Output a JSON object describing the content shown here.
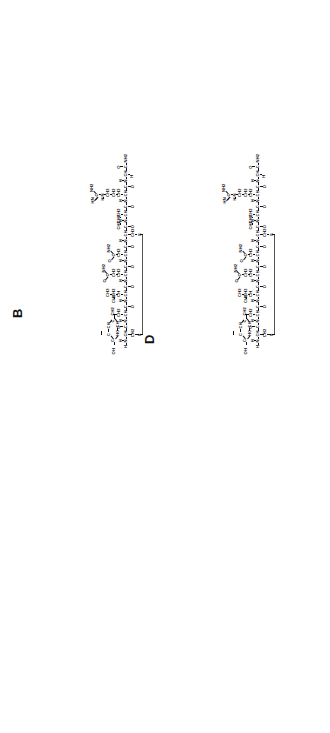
{
  "figure": {
    "orientation": "rotated-90-ccw",
    "background_color": "#ffffff",
    "ink_color": "#111111",
    "bridge_color": "#555555",
    "panel_count": 4
  },
  "panels": [
    {
      "id": "A",
      "label": "A",
      "position": "bottom-left",
      "sequence_label": "peptide-analog-A",
      "has_disulfide_bridge": true,
      "bridge_label": "S-S",
      "highlighted_residue": "C",
      "residues": [
        {
          "name": "Cys1",
          "backbone": "H-N-CH-C=O",
          "side_chain": "CH2-S"
        },
        {
          "name": "Tyr2",
          "backbone": "N-CH-C=O",
          "side_chain": "CH2-phenol-OH"
        },
        {
          "name": "Ile3",
          "backbone": "N-CH-C=O",
          "side_chain": "CH2-CH3"
        },
        {
          "name": "Gln4",
          "backbone": "N-CH-C=O",
          "side_chain": "CH2-CH2-C(=O)-NH2"
        },
        {
          "name": "Asn5",
          "backbone": "N-CH-C=O",
          "side_chain": "CH2-C(=O)-NH2"
        },
        {
          "name": "Cys6",
          "backbone": "N-CH-C=O",
          "side_chain": "CH2-S"
        },
        {
          "name": "Pro7",
          "backbone": "N-CH-C=O",
          "side_chain": "CH2-CH2-CH2"
        },
        {
          "name": "Arg8",
          "backbone": "N-CH-C=O",
          "side_chain": "CH2-CH2-CH2-N-H-C(=NH)-NH2"
        },
        {
          "name": "Gly9",
          "backbone": "N-CH2-C=O",
          "side_chain": "NH2"
        }
      ],
      "atom_labels": [
        "H",
        "N",
        "C",
        "O",
        "S",
        "CH",
        "CH2",
        "CH3",
        "NH",
        "NH2",
        "HN",
        "OH",
        "HC",
        "C=O",
        "O=C"
      ]
    },
    {
      "id": "B",
      "label": "B",
      "position": "top-left",
      "sequence_label": "peptide-analog-B",
      "has_disulfide_bridge": true,
      "bridge_label": "S-S",
      "highlighted_residue": "bold-bar",
      "residues": [
        {
          "name": "Cys1",
          "backbone": "H-N-CH-C=O",
          "side_chain": "CH2-S"
        },
        {
          "name": "Tyr2",
          "backbone": "N-CH-C=O",
          "side_chain": "CH2-phenol-OH"
        },
        {
          "name": "Ile3",
          "backbone": "N-CH-C=O",
          "side_chain": "CH2-CH3"
        },
        {
          "name": "Gln4",
          "backbone": "N-CH-C=O",
          "side_chain": "CH2-CH2-C(=O)-NH2"
        },
        {
          "name": "Asn5",
          "backbone": "N-CH-C=O",
          "side_chain": "CH2-C(=O)-NH2"
        },
        {
          "name": "Cys6",
          "backbone": "N-CH-C=O",
          "side_chain": "CH2-S"
        },
        {
          "name": "Pro7",
          "backbone": "N-CH-C=O",
          "side_chain": "CH2-CH2-CH2"
        },
        {
          "name": "Arg8",
          "backbone": "N-CH-C=O",
          "side_chain": "CH2-CH2-CH2-N-H-C(=NH)-NH2"
        },
        {
          "name": "Gly9",
          "backbone": "N-CH-C=O",
          "side_chain": "NH2"
        }
      ],
      "atom_labels": [
        "H",
        "N",
        "C",
        "O",
        "S",
        "CH",
        "CH2",
        "CH3",
        "NH",
        "NH2",
        "HN",
        "OH",
        "HC",
        "C=O",
        "O=C"
      ]
    },
    {
      "id": "C",
      "label": "C",
      "position": "bottom-right",
      "sequence_label": "peptide-analog-C",
      "has_disulfide_bridge": true,
      "bridge_label": "S-S",
      "highlighted_residue": "bold-bar",
      "residues": [
        {
          "name": "Cys1",
          "backbone": "H-N-CH-C=O",
          "side_chain": "CH2-S"
        },
        {
          "name": "Tyr2",
          "backbone": "N-CH-C=O",
          "side_chain": "CH2-phenol-OH"
        },
        {
          "name": "Ile3",
          "backbone": "N-CH-C=O",
          "side_chain": "CH2-CH3"
        },
        {
          "name": "Gln4",
          "backbone": "N-CH-C=O",
          "side_chain": "CH2-CH2-C(=O)-NH2"
        },
        {
          "name": "Asn5",
          "backbone": "N-CH-C=O",
          "side_chain": "CH2-C(=O)-NH2"
        },
        {
          "name": "Cys6",
          "backbone": "N-CH-C=O",
          "side_chain": "CH2-S"
        },
        {
          "name": "Pro7",
          "backbone": "N-CH-C=O",
          "side_chain": "CH2-CH2-CH2"
        },
        {
          "name": "Lys8",
          "backbone": "N-CH-C=O",
          "side_chain": "CH2-CH2-C=O-NH-CH2-CH2-CH2"
        },
        {
          "name": "Gly9",
          "backbone": "N-CH-C=O",
          "side_chain": "NH2"
        }
      ],
      "atom_labels": [
        "H",
        "N",
        "C",
        "O",
        "S",
        "CH",
        "CH2",
        "CH3",
        "NH",
        "NH2",
        "OH",
        "HC",
        "C=O",
        "O=C"
      ]
    },
    {
      "id": "D",
      "label": "D",
      "position": "top-right",
      "sequence_label": "peptide-analog-D",
      "has_disulfide_bridge": true,
      "bridge_label": "S-S",
      "highlighted_residue": "bold-bar",
      "residues": [
        {
          "name": "Cys1",
          "backbone": "H-N-CH-C=O",
          "side_chain": "CH2-S"
        },
        {
          "name": "Tyr2",
          "backbone": "N-CH-C=O",
          "side_chain": "CH2-phenol-OH"
        },
        {
          "name": "Ile3",
          "backbone": "N-CH-C=O",
          "side_chain": "CH2-CH3"
        },
        {
          "name": "Gln4",
          "backbone": "N-CH-C=O",
          "side_chain": "CH2-CH2-C(=O)-NH2"
        },
        {
          "name": "Asn5",
          "backbone": "N-CH-C=O",
          "side_chain": "CH2-C(=O)-NH2"
        },
        {
          "name": "Cys6",
          "backbone": "N-CH-C=O",
          "side_chain": "CH2-S"
        },
        {
          "name": "Pro7",
          "backbone": "N-CH-C=O",
          "side_chain": "CH2-CH2-CH2"
        },
        {
          "name": "Arg8",
          "backbone": "N-CH-C=O",
          "side_chain": "CH2-CH2-CH2-N-H-C(=NH)-NH2"
        },
        {
          "name": "Gly9",
          "backbone": "N-CH-C=O",
          "side_chain": "NH2"
        }
      ],
      "atom_labels": [
        "H",
        "N",
        "C",
        "O",
        "S",
        "CH",
        "CH2",
        "CH3",
        "NH",
        "NH2",
        "HN",
        "OH",
        "HC",
        "C=O",
        "O=C"
      ]
    }
  ],
  "tokens": {
    "H": "H",
    "N": "N",
    "C": "C",
    "O": "O",
    "S": "S",
    "CH": "CH",
    "CH2": "CH2",
    "CH3": "CH3",
    "NH": "NH",
    "NH2": "NH2",
    "HN": "HN",
    "OH": "OH",
    "HC": "HC",
    "CO": "C=O",
    "OC": "O=C",
    "CNH2": "C-NH2",
    "dash": "-"
  },
  "caption": {
    "text": ""
  }
}
